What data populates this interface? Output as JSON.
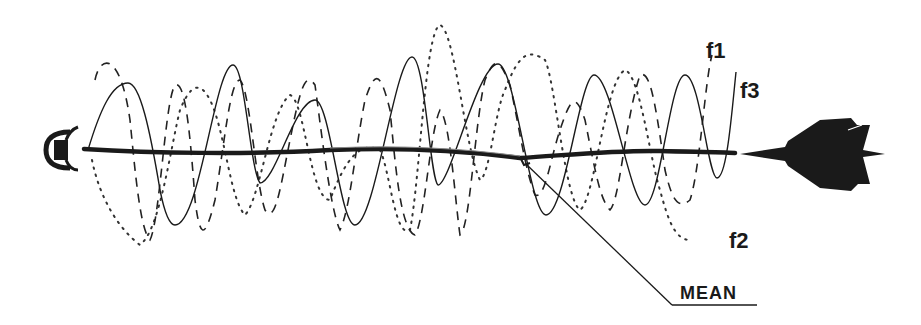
{
  "diagram": {
    "labels": {
      "f1": "f1",
      "f2": "f2",
      "f3": "f3",
      "mean": "MEAN"
    },
    "elements": {
      "transmitter": "radar-dish-icon",
      "target": "jet-aircraft-icon"
    },
    "series": [
      {
        "name": "f1",
        "style": "dashed"
      },
      {
        "name": "f2",
        "style": "dotted"
      },
      {
        "name": "f3",
        "style": "solid"
      },
      {
        "name": "MEAN",
        "style": "thick-solid"
      }
    ],
    "colors": {
      "ink": "#1a1a1a",
      "background": "#ffffff"
    }
  }
}
